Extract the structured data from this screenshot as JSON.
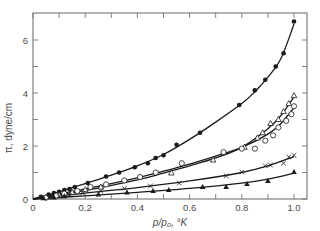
{
  "chart_data": {
    "type": "scatter",
    "title": "",
    "xlabel": "p/p₀, °K",
    "ylabel": "π, dyne/cm",
    "xlim": [
      0,
      1.05
    ],
    "ylim": [
      0,
      7.2
    ],
    "x_ticks": [
      0,
      0.1,
      0.2,
      0.3,
      0.4,
      0.5,
      0.6,
      0.7,
      0.8,
      0.9,
      1.0
    ],
    "x_tick_labels": [
      "0",
      "0.2",
      "0.4",
      "0.6",
      "0.8",
      "1.0"
    ],
    "x_tick_label_values": [
      0,
      0.2,
      0.4,
      0.6,
      0.8,
      1.0
    ],
    "y_ticks": [
      0,
      1,
      2,
      3,
      4,
      5,
      6
    ],
    "y_tick_labels": [
      "0",
      "2",
      "4",
      "6"
    ],
    "y_tick_label_values": [
      0,
      2,
      4,
      6
    ],
    "grid": false,
    "legend": null,
    "series": [
      {
        "name": "filled circles",
        "marker": "filled-circle",
        "x": [
          0.03,
          0.06,
          0.08,
          0.1,
          0.12,
          0.14,
          0.16,
          0.21,
          0.28,
          0.33,
          0.39,
          0.44,
          0.47,
          0.5,
          0.55,
          0.64,
          0.79,
          0.85,
          0.89,
          0.93,
          0.96,
          1.0
        ],
        "y": [
          0.08,
          0.17,
          0.22,
          0.27,
          0.34,
          0.38,
          0.45,
          0.6,
          0.85,
          1.0,
          1.2,
          1.35,
          1.55,
          1.65,
          2.05,
          2.5,
          3.55,
          4.1,
          4.5,
          5.0,
          5.5,
          6.7
        ],
        "curve_x": [
          0,
          0.1,
          0.2,
          0.3,
          0.4,
          0.5,
          0.6,
          0.7,
          0.8,
          0.85,
          0.9,
          0.95,
          1.0
        ],
        "curve_y": [
          0,
          0.27,
          0.58,
          0.9,
          1.25,
          1.68,
          2.25,
          2.9,
          3.6,
          4.05,
          4.6,
          5.3,
          6.6
        ]
      },
      {
        "name": "open triangles",
        "marker": "open-triangle",
        "x": [
          0.05,
          0.1,
          0.15,
          0.2,
          0.26,
          0.53,
          0.69,
          0.81,
          0.86,
          0.88,
          0.91,
          0.94,
          0.96,
          0.98,
          1.0
        ],
        "y": [
          0.06,
          0.15,
          0.25,
          0.35,
          0.45,
          0.98,
          1.47,
          1.95,
          2.3,
          2.5,
          2.85,
          3.0,
          3.3,
          3.6,
          3.9
        ],
        "curve_x": [
          0,
          0.2,
          0.4,
          0.5,
          0.6,
          0.7,
          0.8,
          0.9,
          0.95,
          1.0
        ],
        "curve_y": [
          0,
          0.32,
          0.72,
          0.98,
          1.25,
          1.55,
          1.95,
          2.65,
          3.15,
          3.85
        ]
      },
      {
        "name": "open circles",
        "marker": "open-circle",
        "x": [
          0.05,
          0.09,
          0.12,
          0.17,
          0.22,
          0.28,
          0.35,
          0.41,
          0.47,
          0.57,
          0.73,
          0.8,
          0.85,
          0.89,
          0.92,
          0.94,
          0.97,
          0.99,
          1.0
        ],
        "y": [
          0.05,
          0.13,
          0.2,
          0.3,
          0.45,
          0.55,
          0.7,
          0.83,
          1.0,
          1.35,
          1.77,
          1.9,
          1.9,
          2.2,
          2.4,
          2.7,
          2.95,
          3.2,
          3.5
        ],
        "curve_x": [
          0,
          0.2,
          0.4,
          0.5,
          0.6,
          0.7,
          0.8,
          0.9,
          0.95,
          1.0
        ],
        "curve_y": [
          0,
          0.38,
          0.8,
          1.05,
          1.32,
          1.62,
          1.95,
          2.45,
          2.85,
          3.45
        ]
      },
      {
        "name": "crosses",
        "marker": "cross",
        "x": [
          0.06,
          0.1,
          0.14,
          0.19,
          0.26,
          0.35,
          0.45,
          0.56,
          0.74,
          0.8,
          0.89,
          0.91,
          0.96,
          0.98,
          1.0
        ],
        "y": [
          0.05,
          0.1,
          0.15,
          0.22,
          0.3,
          0.4,
          0.49,
          0.6,
          0.87,
          1.02,
          1.25,
          1.28,
          1.35,
          1.58,
          1.65
        ],
        "curve_x": [
          0,
          0.2,
          0.4,
          0.6,
          0.8,
          0.9,
          1.0
        ],
        "curve_y": [
          0,
          0.22,
          0.43,
          0.68,
          1.0,
          1.25,
          1.6
        ]
      },
      {
        "name": "filled triangles",
        "marker": "filled-triangle",
        "x": [
          0.04,
          0.08,
          0.12,
          0.25,
          0.36,
          0.46,
          0.52,
          0.65,
          0.74,
          0.82,
          0.9,
          1.0
        ],
        "y": [
          0.03,
          0.06,
          0.1,
          0.17,
          0.25,
          0.3,
          0.34,
          0.45,
          0.45,
          0.57,
          0.68,
          1.02
        ],
        "curve_x": [
          0,
          0.2,
          0.4,
          0.6,
          0.8,
          0.9,
          1.0
        ],
        "curve_y": [
          0,
          0.12,
          0.25,
          0.4,
          0.6,
          0.75,
          0.98
        ]
      }
    ]
  },
  "layout": {
    "plot_left": 33,
    "plot_right": 307,
    "plot_top": 13,
    "plot_bottom": 199,
    "x_px_per_unit": 261,
    "y_px_per_unit": 26.5,
    "ink_color": "#1a1a1a",
    "text_color": "#4a4a4a"
  }
}
